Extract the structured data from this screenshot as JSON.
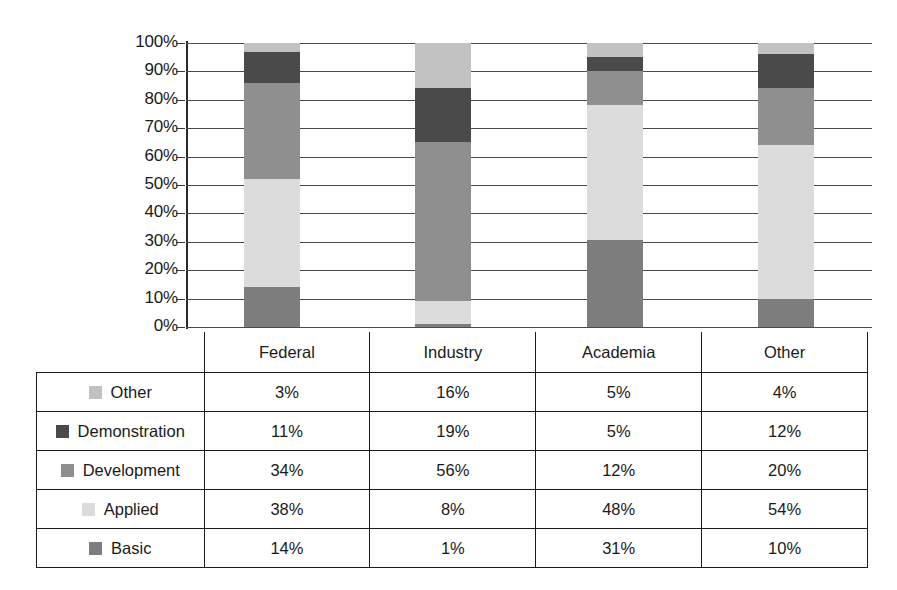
{
  "chart_data": {
    "type": "bar",
    "subtype": "stacked-100-percent",
    "title": "",
    "xlabel": "",
    "ylabel": "",
    "ylim": [
      0,
      100
    ],
    "ytick_labels": [
      "100%",
      "90%",
      "80%",
      "70%",
      "60%",
      "50%",
      "40%",
      "30%",
      "20%",
      "10%",
      "0%"
    ],
    "ytick_values": [
      100,
      90,
      80,
      70,
      60,
      50,
      40,
      30,
      20,
      10,
      0
    ],
    "grid": true,
    "legend_position": "table-below",
    "categories": [
      "Federal",
      "Industry",
      "Academia",
      "Other"
    ],
    "stack_order_bottom_to_top": [
      "Basic",
      "Applied",
      "Development",
      "Demonstration",
      "Other"
    ],
    "series": [
      {
        "name": "Basic",
        "color": "#7d7d7d",
        "values": [
          14,
          1,
          31,
          10
        ],
        "labels": [
          "14%",
          "1%",
          "31%",
          "10%"
        ]
      },
      {
        "name": "Applied",
        "color": "#dcdcdc",
        "values": [
          38,
          8,
          48,
          54
        ],
        "labels": [
          "38%",
          "8%",
          "48%",
          "54%"
        ]
      },
      {
        "name": "Development",
        "color": "#8f8f8f",
        "values": [
          34,
          56,
          12,
          20
        ],
        "labels": [
          "34%",
          "56%",
          "12%",
          "20%"
        ]
      },
      {
        "name": "Demonstration",
        "color": "#4a4a4a",
        "values": [
          11,
          19,
          5,
          12
        ],
        "labels": [
          "11%",
          "19%",
          "5%",
          "12%"
        ]
      },
      {
        "name": "Other",
        "color": "#c2c2c2",
        "values": [
          3,
          16,
          5,
          4
        ],
        "labels": [
          "3%",
          "16%",
          "5%",
          "4%"
        ]
      }
    ]
  },
  "table": {
    "header": {
      "label_col": "",
      "columns": [
        "Federal",
        "Industry",
        "Academia",
        "Other"
      ]
    },
    "rows": [
      {
        "label": "Other",
        "color": "#c2c2c2",
        "values": [
          "3%",
          "16%",
          "5%",
          "4%"
        ]
      },
      {
        "label": "Demonstration",
        "color": "#4a4a4a",
        "values": [
          "11%",
          "19%",
          "5%",
          "12%"
        ]
      },
      {
        "label": "Development",
        "color": "#8f8f8f",
        "values": [
          "34%",
          "56%",
          "12%",
          "20%"
        ]
      },
      {
        "label": "Applied",
        "color": "#dcdcdc",
        "values": [
          "38%",
          "8%",
          "48%",
          "54%"
        ]
      },
      {
        "label": "Basic",
        "color": "#7d7d7d",
        "values": [
          "14%",
          "1%",
          "31%",
          "10%"
        ]
      }
    ]
  },
  "colors": {
    "basic": "#7d7d7d",
    "applied": "#dcdcdc",
    "development": "#8f8f8f",
    "demonstration": "#4a4a4a",
    "other": "#c2c2c2",
    "axis": "#1a1a1a",
    "grid": "#4a4a4a",
    "background": "#ffffff"
  }
}
